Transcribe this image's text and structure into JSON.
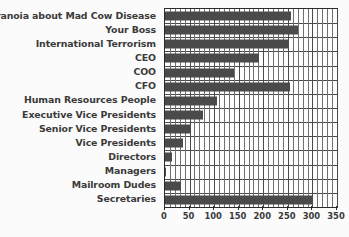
{
  "chart_data": {
    "type": "bar",
    "orientation": "horizontal",
    "title": "",
    "xlabel": "",
    "ylabel": "",
    "xlim": [
      0,
      350
    ],
    "xticks": [
      0,
      50,
      100,
      150,
      200,
      250,
      300,
      350
    ],
    "xtick_labels": [
      "0",
      "50",
      "100",
      "150",
      "200",
      "250",
      "300",
      "350"
    ],
    "grid": true,
    "legend": false,
    "bar_color": "#4a4a4a",
    "axis_color": "#2b2b2b",
    "background_color": "#fbfbfb",
    "categories": [
      "Paranoia about Mad Cow Disease",
      "Your Boss",
      "International Terrorism",
      "CEO",
      "COO",
      "CFO",
      "Human Resources People",
      "Executive Vice Presidents",
      "Senior Vice Presidents",
      "Vice Presidents",
      "Directors",
      "Managers",
      "Mailroom Dudes",
      "Secretaries"
    ],
    "values": [
      257,
      270,
      251,
      192,
      141,
      255,
      106,
      77,
      53,
      37,
      14,
      3,
      33,
      300
    ]
  }
}
